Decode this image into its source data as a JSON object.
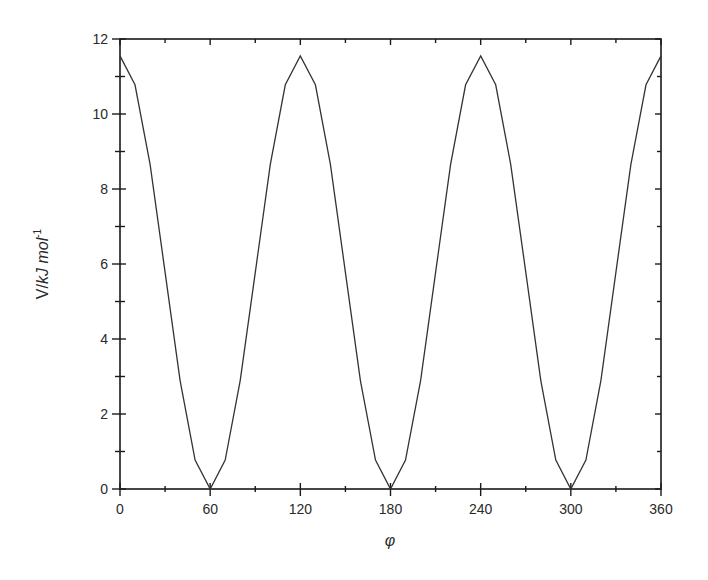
{
  "chart_data": {
    "type": "line",
    "title": "",
    "xlabel": "φ",
    "ylabel": "V/kJ mol⁻¹",
    "ylabel_parts": {
      "prefix": "V/",
      "italic": "kJ mol",
      "sup": "-1"
    },
    "xlim": [
      0,
      360
    ],
    "ylim": [
      0,
      12
    ],
    "x_ticks": [
      0,
      60,
      120,
      180,
      240,
      300,
      360
    ],
    "x_minor_step": 30,
    "y_ticks": [
      0,
      2,
      4,
      6,
      8,
      10,
      12
    ],
    "y_minor_step": 1,
    "grid": false,
    "legend": null,
    "series": [
      {
        "name": "V(φ)",
        "color": "#333333",
        "x": [
          0,
          10,
          20,
          30,
          40,
          50,
          60,
          70,
          80,
          90,
          100,
          110,
          120,
          130,
          140,
          150,
          160,
          170,
          180,
          190,
          200,
          210,
          220,
          230,
          240,
          250,
          260,
          270,
          280,
          290,
          300,
          310,
          320,
          330,
          340,
          350,
          360
        ],
        "values": [
          11.55,
          10.78,
          8.66,
          5.78,
          2.89,
          0.77,
          0.0,
          0.77,
          2.89,
          5.78,
          8.66,
          10.78,
          11.55,
          10.78,
          8.66,
          5.78,
          2.89,
          0.77,
          0.0,
          0.77,
          2.89,
          5.78,
          8.66,
          10.78,
          11.55,
          10.78,
          8.66,
          5.78,
          2.89,
          0.77,
          0.0,
          0.77,
          2.89,
          5.78,
          8.66,
          10.78,
          11.55
        ]
      }
    ]
  },
  "layout": {
    "plot_left": 120,
    "plot_right": 661,
    "plot_top": 39,
    "plot_bottom": 489,
    "axis_color": "#1a1a1a"
  }
}
